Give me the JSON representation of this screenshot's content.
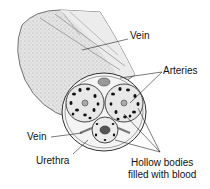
{
  "labels": {
    "vein_top": "Vein",
    "arteries": "Arteries",
    "vein_left": "Vein",
    "urethra": "Urethra",
    "hollow_line1": "Hollow bodies",
    "hollow_line2": "filled with blood"
  }
}
